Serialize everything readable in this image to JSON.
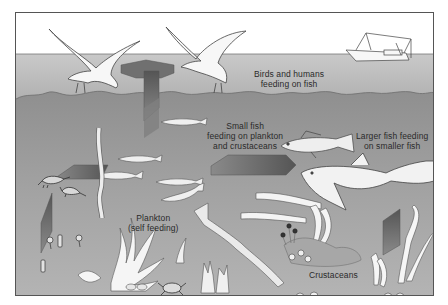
{
  "diagram": {
    "colors": {
      "sky": "#ffffff",
      "surface_water": "#b8b8b8",
      "deep_water": "#9a9a9a",
      "arrow_dark": "#6a6a6a",
      "arrow_light": "#8c8c8c",
      "outline": "#444444",
      "organism_fill": "#f4f4f4"
    },
    "labels": {
      "birds_humans": [
        "Birds and humans",
        "feeding on fish"
      ],
      "small_fish": [
        "Small fish",
        "feeding on plankton",
        "and crustaceans"
      ],
      "larger_fish": [
        "Larger fish feeding",
        "on smaller fish"
      ],
      "plankton": [
        "Plankton",
        "(self feeding)"
      ],
      "crustaceans": [
        "Crustaceans"
      ]
    },
    "elements": [
      {
        "name": "seagull-left",
        "type": "bird"
      },
      {
        "name": "seagull-right",
        "type": "bird"
      },
      {
        "name": "fishing-boat",
        "type": "boat"
      },
      {
        "name": "small-fish-group",
        "type": "fish",
        "count": 5
      },
      {
        "name": "cod",
        "type": "fish"
      },
      {
        "name": "shark",
        "type": "fish"
      },
      {
        "name": "shrimp-pair",
        "type": "crustacean",
        "count": 2
      },
      {
        "name": "crab",
        "type": "crustacean"
      },
      {
        "name": "shells",
        "type": "crustacean"
      },
      {
        "name": "seaweed",
        "type": "plant"
      },
      {
        "name": "coral-plankton",
        "type": "plankton"
      },
      {
        "name": "energy-arrows",
        "type": "arrow",
        "count": 6
      }
    ]
  }
}
